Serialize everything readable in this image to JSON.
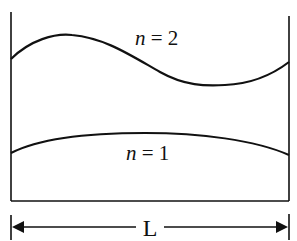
{
  "diagram": {
    "type": "standing-wave-modes",
    "modes": [
      {
        "id": "n2",
        "label_var": "n",
        "label_eq": " = 2",
        "description": "second mode, one full wavelength across L"
      },
      {
        "id": "n1",
        "label_var": "n",
        "label_eq": " = 1",
        "description": "fundamental mode, half wavelength across L"
      }
    ],
    "dimension": {
      "label": "L",
      "description": "length between walls"
    },
    "colors": {
      "stroke": "#111111",
      "background": "#ffffff"
    }
  }
}
